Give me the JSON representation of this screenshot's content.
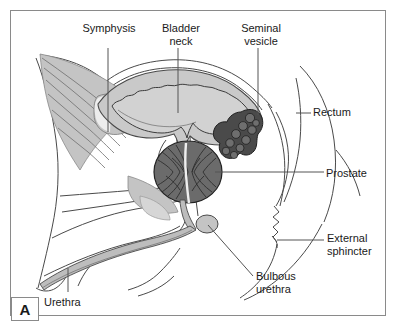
{
  "figure": {
    "panel_label": "A",
    "border_color": "#8a8a8a",
    "background": "#ffffff"
  },
  "colors": {
    "outline": "#4a4a4a",
    "text": "#1a1a1a",
    "leader_line": "#555555",
    "bladder_fill": "#d2d2d2",
    "bladder_wall": "#c9c9c9",
    "prostate_fill": "#6b6b6b",
    "prostate_detail": "#2e2e2e",
    "seminal_vesicle_fill": "#4a4a4a",
    "seminal_vesicle_detail": "#202020",
    "muscle_fill": "#c4c4c4",
    "urethra_fill": "#bdbdbd",
    "bulb_fill": "#c4c4c4"
  },
  "labels": [
    {
      "id": "symphysis",
      "text": "Symphysis",
      "align": "center",
      "x": 74,
      "y": 22,
      "width": 70
    },
    {
      "id": "bladder-neck",
      "text": "Bladder\nneck",
      "align": "center",
      "x": 148,
      "y": 22,
      "width": 66
    },
    {
      "id": "seminal-vesicle",
      "text": "Seminal\nvesicle",
      "align": "center",
      "x": 228,
      "y": 22,
      "width": 66
    },
    {
      "id": "rectum",
      "text": "Rectum",
      "align": "left",
      "x": 313,
      "y": 106,
      "width": 70
    },
    {
      "id": "prostate",
      "text": "Prostate",
      "align": "left",
      "x": 326,
      "y": 167,
      "width": 70
    },
    {
      "id": "external-sphincter",
      "text": "External\nsphincter",
      "align": "left",
      "x": 327,
      "y": 232,
      "width": 68
    },
    {
      "id": "bulbous-urethra",
      "text": "Bulbous\nurethra",
      "align": "left",
      "x": 256,
      "y": 270,
      "width": 70
    },
    {
      "id": "urethra",
      "text": "Urethra",
      "align": "left",
      "x": 44,
      "y": 296,
      "width": 60
    }
  ],
  "leader_lines": [
    {
      "id": "symphysis-leader",
      "x1": 108,
      "y1": 48,
      "x2": 108,
      "y2": 132
    },
    {
      "id": "bladder-neck-leader",
      "x1": 178,
      "y1": 48,
      "x2": 178,
      "y2": 113
    },
    {
      "id": "seminal-vesicle-leader",
      "x1": 258,
      "y1": 48,
      "x2": 258,
      "y2": 115
    },
    {
      "id": "rectum-leader",
      "x1": 311,
      "y1": 113,
      "x2": 296,
      "y2": 113
    },
    {
      "id": "prostate-leader",
      "x1": 324,
      "y1": 172,
      "x2": 215,
      "y2": 172
    },
    {
      "id": "external-sphincter-leader",
      "x1": 324,
      "y1": 240,
      "x2": 277,
      "y2": 240
    },
    {
      "id": "bulbous-urethra-leader",
      "x1": 253,
      "y1": 276,
      "x2": 208,
      "y2": 225
    },
    {
      "id": "urethra-leader",
      "x1": 68,
      "y1": 292,
      "x2": 68,
      "y2": 268
    }
  ],
  "anatomy_parts": [
    {
      "id": "bladder",
      "name": "Urinary bladder"
    },
    {
      "id": "bladder-neck",
      "name": "Bladder neck"
    },
    {
      "id": "prostate",
      "name": "Prostate gland"
    },
    {
      "id": "seminal-vesicle",
      "name": "Seminal vesicle"
    },
    {
      "id": "rectum",
      "name": "Rectum"
    },
    {
      "id": "external-sphincter",
      "name": "External sphincter"
    },
    {
      "id": "bulbous-urethra",
      "name": "Bulbous urethra"
    },
    {
      "id": "penile-urethra",
      "name": "Penile urethra"
    },
    {
      "id": "pubic-symphysis",
      "name": "Pubic symphysis"
    },
    {
      "id": "pelvic-muscle",
      "name": "Pelvic floor musculature"
    }
  ]
}
